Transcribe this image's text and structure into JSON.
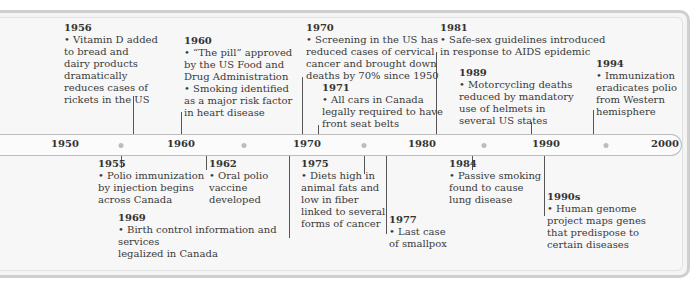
{
  "timeline": {
    "ticks": [
      {
        "label": "1950",
        "x": 65
      },
      {
        "label": "1960",
        "x": 181
      },
      {
        "label": "1970",
        "x": 307
      },
      {
        "label": "1980",
        "x": 422
      },
      {
        "label": "1990",
        "x": 546
      },
      {
        "label": "2000",
        "x": 665
      }
    ],
    "dots": [
      121,
      244,
      364,
      484,
      606
    ]
  },
  "events_above": [
    {
      "year": "1956",
      "lines": [
        "• Vitamin D added",
        "to bread and",
        "dairy products",
        "dramatically",
        "reduces cases of",
        "rickets in the US"
      ]
    },
    {
      "year": "1960",
      "lines": [
        "• “The pill” approved",
        "by the US Food and",
        "Drug Administration",
        "• Smoking identified",
        "as a major risk factor",
        "in heart disease"
      ]
    },
    {
      "year": "1970",
      "lines": [
        "• Screening in the US has",
        "reduced cases of cervical",
        "cancer and brought down",
        "deaths by 70% since 1950"
      ]
    },
    {
      "year": "1971",
      "lines": [
        "• All cars in Canada",
        "legally required to have",
        "front seat belts"
      ]
    },
    {
      "year": "1981",
      "lines": [
        "• Safe-sex guidelines introduced",
        "in response to AIDS epidemic"
      ]
    },
    {
      "year": "1989",
      "lines": [
        "• Motorcycling deaths",
        "reduced by mandatory",
        "use of helmets in",
        "several US states"
      ]
    },
    {
      "year": "1994",
      "lines": [
        "• Immunization",
        "eradicates polio",
        "from Western",
        "hemisphere"
      ]
    }
  ],
  "events_below": [
    {
      "year": "1955",
      "lines": [
        "• Polio immunization",
        "by injection begins",
        "across Canada"
      ]
    },
    {
      "year": "1962",
      "lines": [
        "• Oral polio",
        "vaccine",
        "developed"
      ]
    },
    {
      "year": "1969",
      "lines": [
        "• Birth control information and services",
        "legalized in Canada"
      ]
    },
    {
      "year": "1975",
      "lines": [
        "• Diets high in",
        "animal fats and",
        "low in fiber",
        "linked to several",
        "forms of cancer"
      ]
    },
    {
      "year": "1977",
      "lines": [
        "• Last case",
        "of smallpox"
      ]
    },
    {
      "year": "1984",
      "lines": [
        "• Passive smoking",
        "found to cause",
        "lung disease"
      ]
    },
    {
      "year": "1990s",
      "lines": [
        "• Human genome",
        "project maps genes",
        "that predispose to",
        "certain diseases"
      ]
    }
  ],
  "colors": {
    "frame": "#cfcfcf",
    "panel": "#f4f4f4",
    "bar": "#fbfbfb",
    "dot": "#bcbcbc",
    "text": "#3a3a3a"
  }
}
